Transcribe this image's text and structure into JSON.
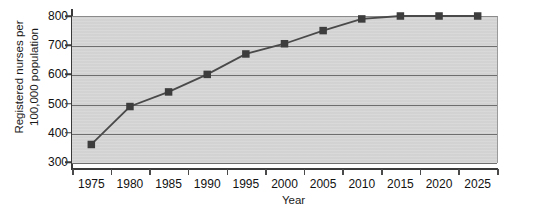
{
  "chart_data": {
    "type": "line",
    "title": "",
    "xlabel": "Year",
    "ylabel": "Registered nurses per 100,000 population",
    "ylabel_line1": "Registered nurses per",
    "ylabel_line2": "100,000 population",
    "categories": [
      1975,
      1980,
      1985,
      1990,
      1995,
      2000,
      2005,
      2010,
      2015,
      2020,
      2025
    ],
    "x_tick_labels": [
      "1975",
      "1980",
      "1985",
      "1990",
      "1995",
      "2000",
      "2005",
      "2010",
      "2015",
      "2020",
      "2025"
    ],
    "values": [
      360,
      490,
      540,
      600,
      670,
      705,
      750,
      790,
      800,
      800,
      800
    ],
    "y_tick_labels": [
      "800",
      "700",
      "600",
      "500",
      "400",
      "300"
    ],
    "y_ticks": [
      800,
      700,
      600,
      500,
      400,
      300
    ],
    "ylim": [
      300,
      800
    ],
    "grid": true,
    "grid_axis": "y",
    "legend": false,
    "marker": "square",
    "series": [
      {
        "name": "Registered nurses per 100,000 population",
        "values": [
          360,
          490,
          540,
          600,
          670,
          705,
          750,
          790,
          800,
          800,
          800
        ]
      }
    ],
    "colors": {
      "plot_background": "#d5d5d5",
      "gridline": "#6e6e6e",
      "axis": "#3a3a3a",
      "line": "#4a4a4a",
      "marker": "#3d3d3d",
      "page_background": "#ffffff",
      "text": "#111111"
    }
  }
}
